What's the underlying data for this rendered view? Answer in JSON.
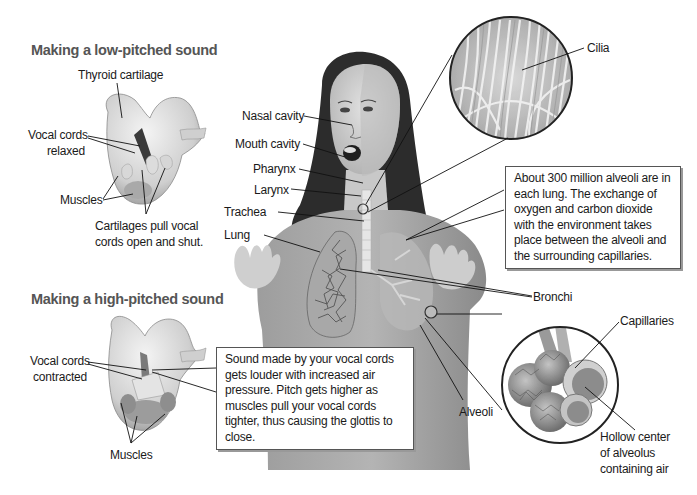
{
  "low_pitch": {
    "heading": "Making a low-pitched sound",
    "labels": {
      "thyroid": "Thyroid cartilage",
      "vocal_cords_1": "Vocal cords",
      "vocal_cords_2": "relaxed",
      "muscles": "Muscles",
      "cartilages_1": "Cartilages pull vocal",
      "cartilages_2": "cords open and shut."
    }
  },
  "high_pitch": {
    "heading": "Making a high-pitched sound",
    "labels": {
      "vocal_cords_1": "Vocal cords",
      "vocal_cords_2": "contracted",
      "muscles": "Muscles"
    },
    "callout": "Sound made by your vocal cords gets louder with increased air pressure. Pitch gets higher as muscles pull your vocal cords tighter, thus causing the glottis to close."
  },
  "body_labels": {
    "nasal_cavity": "Nasal cavity",
    "mouth_cavity": "Mouth cavity",
    "pharynx": "Pharynx",
    "larynx": "Larynx",
    "trachea": "Trachea",
    "lung": "Lung",
    "bronchi": "Bronchi",
    "alveoli": "Alveoli"
  },
  "cilia_inset": {
    "label": "Cilia"
  },
  "alveoli_callout": "About 300 million alveoli are in each lung. The exchange of oxygen and carbon dioxide with the environment takes place between the alveoli and the surrounding capillaries.",
  "alveolus_inset": {
    "capillaries": "Capillaries",
    "hollow_1": "Hollow center",
    "hollow_2": "of alveolus",
    "hollow_3": "containing air"
  }
}
